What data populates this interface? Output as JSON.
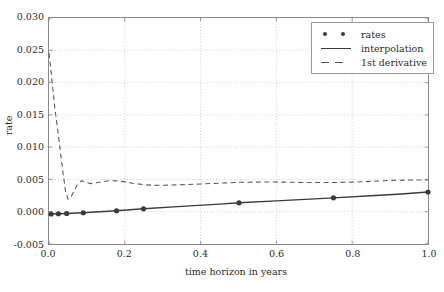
{
  "chart_data": {
    "type": "line",
    "title": "",
    "xlabel": "time horizon in years",
    "ylabel": "rate",
    "xlim": [
      0.0,
      1.0
    ],
    "ylim": [
      -0.005,
      0.03
    ],
    "grid": true,
    "legend_position": "upper right",
    "xticks": [
      "0.0",
      "0.2",
      "0.4",
      "0.6",
      "0.8",
      "1.0"
    ],
    "xtick_values": [
      0.0,
      0.2,
      0.4,
      0.6,
      0.8,
      1.0
    ],
    "yticks": [
      "-0.005",
      "0.000",
      "0.005",
      "0.010",
      "0.015",
      "0.020",
      "0.025",
      "0.030"
    ],
    "ytick_values": [
      -0.005,
      0.0,
      0.005,
      0.01,
      0.015,
      0.02,
      0.025,
      0.03
    ],
    "series": [
      {
        "name": "rates",
        "style": "markers",
        "marker": "circle",
        "color": "#3b3b3b",
        "x": [
          0.0055,
          0.0247,
          0.0466,
          0.0904,
          0.1781,
          0.2493,
          0.5014,
          0.7506,
          1.0
        ],
        "y": [
          -0.00035,
          -0.00032,
          -0.00028,
          -0.00016,
          0.00015,
          0.00045,
          0.00138,
          0.00215,
          0.00305
        ]
      },
      {
        "name": "interpolation",
        "style": "solid-line",
        "color": "#3b3b3b",
        "x": [
          0.0,
          0.0055,
          0.0247,
          0.0466,
          0.0904,
          0.1781,
          0.2493,
          0.35,
          0.45,
          0.5014,
          0.6,
          0.7,
          0.7506,
          0.85,
          0.93,
          1.0
        ],
        "y": [
          -0.00036,
          -0.00035,
          -0.00032,
          -0.00028,
          -0.00016,
          0.00015,
          0.00045,
          0.00083,
          0.00118,
          0.00138,
          0.00168,
          0.00198,
          0.00215,
          0.00248,
          0.00275,
          0.00305
        ]
      },
      {
        "name": "1st derivative",
        "style": "dashed-line",
        "color": "#5a5a5a",
        "x": [
          0.0,
          0.004,
          0.009,
          0.016,
          0.024,
          0.031,
          0.038,
          0.0435,
          0.05,
          0.057,
          0.065,
          0.075,
          0.086,
          0.097,
          0.11,
          0.125,
          0.14,
          0.16,
          0.178,
          0.2,
          0.22,
          0.25,
          0.28,
          0.32,
          0.36,
          0.4,
          0.45,
          0.5,
          0.56,
          0.62,
          0.68,
          0.75,
          0.8,
          0.85,
          0.9,
          0.95,
          1.0
        ],
        "y": [
          0.02455,
          0.0225,
          0.0196,
          0.0158,
          0.0122,
          0.0088,
          0.0056,
          0.0032,
          0.00195,
          0.0022,
          0.0031,
          0.0042,
          0.0048,
          0.00455,
          0.00435,
          0.00448,
          0.00465,
          0.0048,
          0.00478,
          0.00462,
          0.00442,
          0.00418,
          0.00408,
          0.00412,
          0.0042,
          0.0043,
          0.00442,
          0.00455,
          0.0046,
          0.00458,
          0.00452,
          0.00452,
          0.00458,
          0.0047,
          0.00485,
          0.0049,
          0.00492
        ]
      }
    ]
  },
  "legend": {
    "items": [
      {
        "label": "rates",
        "style": "markers"
      },
      {
        "label": "interpolation",
        "style": "solid"
      },
      {
        "label": "1st derivative",
        "style": "dashed"
      }
    ]
  },
  "colors": {
    "marker": "#3b3b3b",
    "interpolation": "#3b3b3b",
    "derivative": "#5a5a5a",
    "grid": "#bdbdbd",
    "axis": "#8a8a8a",
    "text": "#2b2b2b",
    "background": "#ffffff"
  }
}
